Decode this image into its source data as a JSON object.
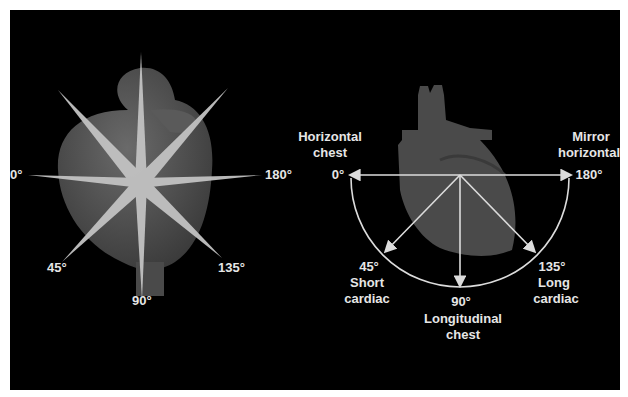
{
  "figure": {
    "background": "#000000",
    "left_panel": {
      "description": "3D heart with transducer imaging planes at various rotation angles",
      "angle_labels": [
        "0°",
        "180°",
        "45°",
        "90°",
        "135°"
      ]
    },
    "right_panel": {
      "description": "Semicircular protractor of transducer rotation angles over heart silhouette",
      "angles": [
        {
          "angle": "0°",
          "name_line1": "Horizontal",
          "name_line2": "chest"
        },
        {
          "angle": "180°",
          "name_line1": "Mirror",
          "name_line2": "horizontal"
        },
        {
          "angle": "45°",
          "name_line1": "Short",
          "name_line2": "cardiac"
        },
        {
          "angle": "90°",
          "name_line1": "Longitudinal",
          "name_line2": "chest"
        },
        {
          "angle": "135°",
          "name_line1": "Long",
          "name_line2": "cardiac"
        }
      ]
    },
    "colors": {
      "label": "#e6e6e6",
      "heart": "#4a4a4a",
      "plane": "#bdbdbd",
      "arrow": "#dcdcdc"
    }
  }
}
